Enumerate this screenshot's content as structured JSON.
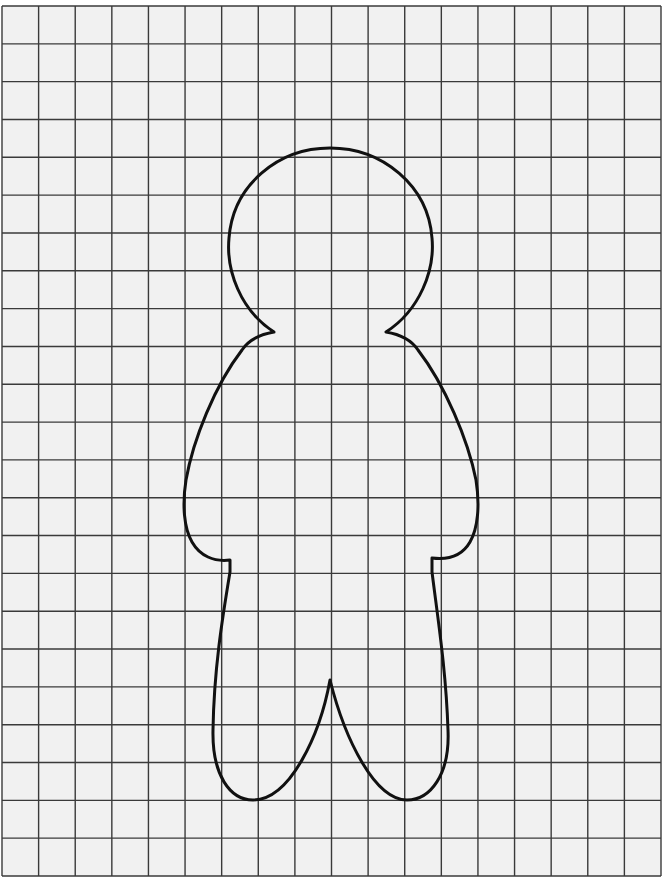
{
  "page": {
    "type": "template-worksheet",
    "header_fragment": ""
  },
  "colors": {
    "paper": "#f1f1f1",
    "grid_line": "#3a3a3a",
    "outline": "#111111"
  },
  "grid": {
    "left": 2,
    "top": 6,
    "right": 661,
    "bottom": 876,
    "columns": 18,
    "rows": 23,
    "line_width": 1.4
  },
  "figure": {
    "name": "gingerbread-person-outline",
    "stroke_width": 3,
    "path": "M 274 332 C 240 310, 226 270, 229 238 C 233 185, 278 148, 330 148 C 382 148, 428 185, 432 238 C 435 270, 420 310, 386 332 C 398 334, 410 338, 418 350 C 445 385, 468 440, 476 480 C 480 505, 478 528, 470 542 C 462 556, 448 560, 432 558 L 432 572 C 438 620, 446 670, 448 730 C 450 775, 430 800, 407 800 C 375 800, 345 740, 330 680 C 320 735, 290 800, 253 800 C 230 800, 212 775, 213 730 C 214 670, 222 620, 230 572 L 230 560 C 214 562, 200 556, 192 542 C 184 528, 182 505, 186 480 C 193 440, 215 385, 242 350 C 250 338, 262 334, 274 332 Z"
  }
}
